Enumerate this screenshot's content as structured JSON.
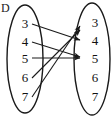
{
  "diagram": {
    "type": "function-mapping-diagram",
    "title_label": "D",
    "stroke_color": "#1a1a1a",
    "text_color": "#111111",
    "background_color": "#ffffff",
    "domain_set": {
      "name": "D",
      "shape": "ellipse",
      "elements": [
        {
          "id": "d3",
          "label": "3"
        },
        {
          "id": "d4",
          "label": "4"
        },
        {
          "id": "d5",
          "label": "5"
        },
        {
          "id": "d6",
          "label": "6"
        },
        {
          "id": "d7",
          "label": "7"
        }
      ]
    },
    "codomain_set": {
      "name": "",
      "shape": "ellipse",
      "elements": [
        {
          "id": "c3",
          "label": "3"
        },
        {
          "id": "c4",
          "label": "4"
        },
        {
          "id": "c5",
          "label": "5"
        },
        {
          "id": "c6",
          "label": "6"
        },
        {
          "id": "c7",
          "label": "7"
        }
      ]
    },
    "arrows": [
      {
        "from": "d3",
        "to": "c4",
        "from_label": "3",
        "to_label": "4"
      },
      {
        "from": "d4",
        "to": "c5",
        "from_label": "4",
        "to_label": "5"
      },
      {
        "from": "d5",
        "to": "c5",
        "from_label": "5",
        "to_label": "5"
      },
      {
        "from": "d6",
        "to": "c3",
        "from_label": "6",
        "to_label": "3"
      },
      {
        "from": "d7",
        "to": "c3",
        "from_label": "7",
        "to_label": "3"
      }
    ],
    "unmapped_codomain_elements": [
      "6",
      "7"
    ]
  }
}
